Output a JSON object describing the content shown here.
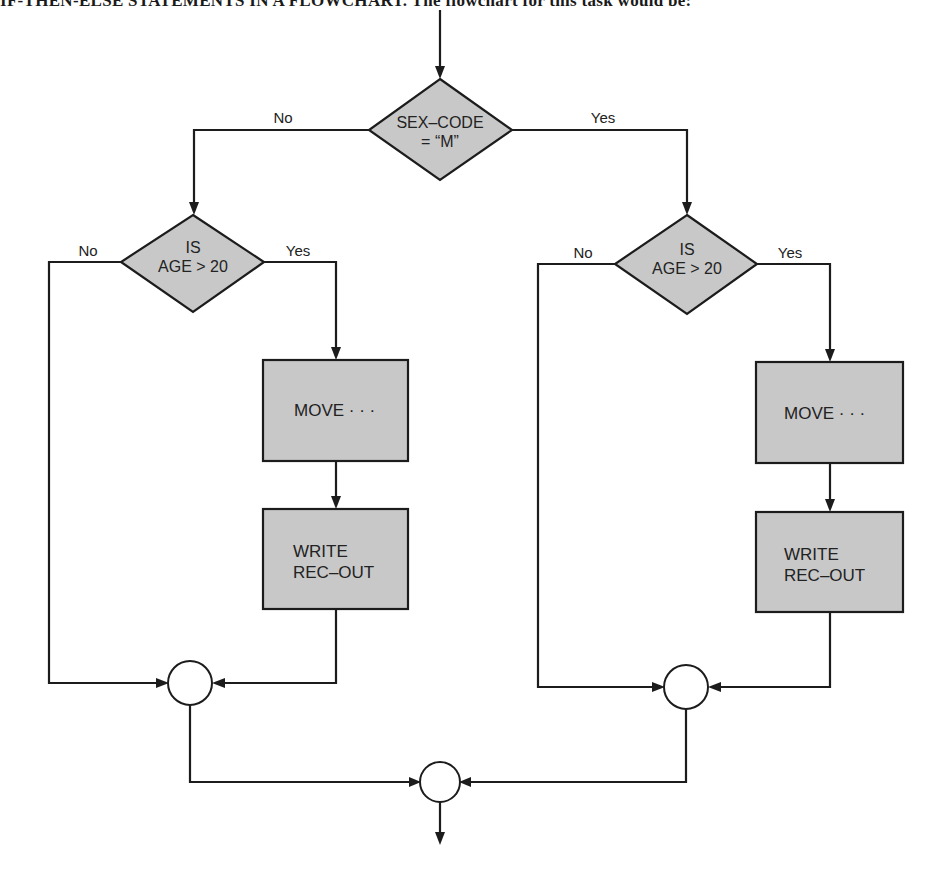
{
  "heading": {
    "text": "IF-THEN-ELSE STATEMENTS IN A FLOWCHART. The flowchart for this task would be:"
  },
  "flowchart": {
    "decision_top": {
      "line1": "SEX–CODE",
      "line2": "= “M”",
      "no_label": "No",
      "yes_label": "Yes"
    },
    "left_branch": {
      "decision": {
        "line1": "IS",
        "line2": "AGE > 20",
        "no_label": "No",
        "yes_label": "Yes"
      },
      "process_move": {
        "label": "MOVE · · ·"
      },
      "process_write": {
        "line1": "WRITE",
        "line2": "REC–OUT"
      }
    },
    "right_branch": {
      "decision": {
        "line1": "IS",
        "line2": "AGE > 20",
        "no_label": "No",
        "yes_label": "Yes"
      },
      "process_move": {
        "label": "MOVE · · ·"
      },
      "process_write": {
        "line1": "WRITE",
        "line2": "REC–OUT"
      }
    },
    "connectors": [
      "left-join",
      "right-join",
      "final-join"
    ],
    "colors": {
      "shape_fill": "#c8c8c8",
      "stroke": "#1c1c1c",
      "background": "#ffffff"
    }
  }
}
